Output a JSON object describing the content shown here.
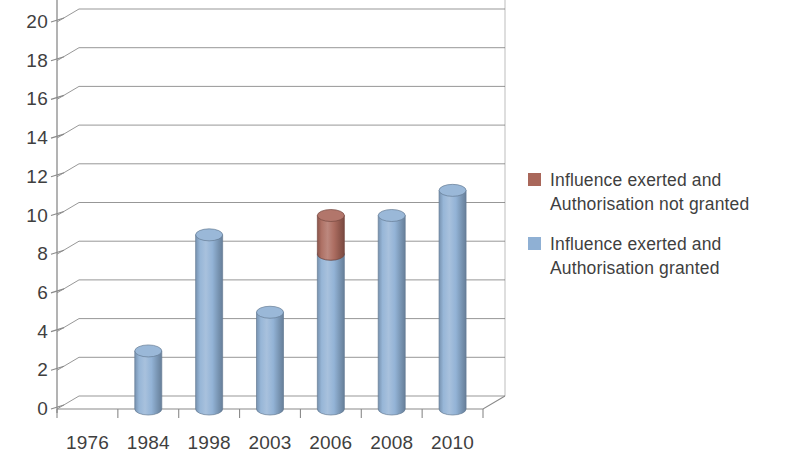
{
  "chart_data": {
    "type": "bar",
    "title": "",
    "subtitle": "",
    "xlabel": "",
    "ylabel": "",
    "categories": [
      "1976",
      "1984",
      "1998",
      "2003",
      "2006",
      "2008",
      "2010"
    ],
    "series": [
      {
        "name": "Influence exerted and Authorisation granted",
        "color": "#8FB0D4",
        "values": [
          0,
          3,
          9,
          5,
          8,
          10,
          11.3
        ]
      },
      {
        "name": "Influence exerted and Authorisation not granted",
        "color": "#A9675A",
        "values": [
          0,
          0,
          0,
          0,
          2,
          0,
          0
        ]
      }
    ],
    "stacked": true,
    "ylim": [
      0,
      21
    ],
    "ytick_values": [
      0,
      2,
      4,
      6,
      8,
      10,
      12,
      14,
      16,
      18,
      20
    ],
    "ytick_labels": [
      "0",
      "2",
      "4",
      "6",
      "8",
      "10",
      "12",
      "14",
      "16",
      "18",
      "20"
    ],
    "grid": true,
    "grid_axis": "y",
    "legend_position": "right",
    "style": "3d-cylinder",
    "annotations": []
  },
  "legend": {
    "items": [
      {
        "label": "Influence exerted and Authorisation not granted",
        "color": "#A9675A"
      },
      {
        "label": "Influence exerted and Authorisation granted",
        "color": "#8FB0D4"
      }
    ]
  },
  "colors": {
    "series_not_granted": "#A9675A",
    "series_granted": "#8FB0D4",
    "axis": "#8a8a8a",
    "gridline": "#6f6f6f",
    "text": "#3f3f3f",
    "background": "#ffffff"
  }
}
